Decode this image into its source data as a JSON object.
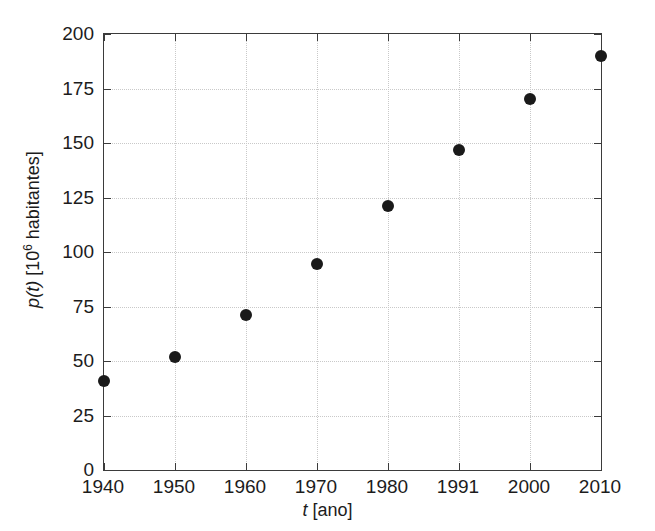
{
  "chart_data": {
    "type": "scatter",
    "title": "",
    "xlabel": "t [ano]",
    "ylabel": "p(t) [10^6 habitantes]",
    "ylabel_parts": {
      "symbol": "p",
      "arg": "(t)",
      "units_prefix": " [10",
      "units_exponent": "6",
      "units_suffix": " habitantes]"
    },
    "xlabel_parts": {
      "symbol": "t",
      "units": " [ano]"
    },
    "categories": [
      "1940",
      "1950",
      "1960",
      "1970",
      "1980",
      "1991",
      "2000",
      "2010"
    ],
    "x": [
      1940,
      1950,
      1960,
      1970,
      1980,
      1991,
      2000,
      2010
    ],
    "values": [
      41,
      52,
      71,
      94.5,
      121,
      147,
      170,
      190
    ],
    "series": [
      {
        "name": "p(t)",
        "values": [
          41,
          52,
          71,
          94.5,
          121,
          147,
          170,
          190
        ],
        "marker": "filled-circle",
        "color": "#1a1a1a"
      }
    ],
    "ylim": [
      0,
      200
    ],
    "yticks": [
      0,
      25,
      50,
      75,
      100,
      125,
      150,
      175,
      200
    ],
    "ytick_labels": [
      "0",
      "25",
      "50",
      "75",
      "100",
      "125",
      "150",
      "175",
      "200"
    ],
    "xtick_labels": [
      "1940",
      "1950",
      "1960",
      "1970",
      "1980",
      "1991",
      "2000",
      "2010"
    ],
    "grid": true,
    "grid_style": "dotted",
    "grid_color": "#c9c9c9",
    "legend": false,
    "axis_color": "#3b3b3b",
    "background": "#ffffff"
  }
}
